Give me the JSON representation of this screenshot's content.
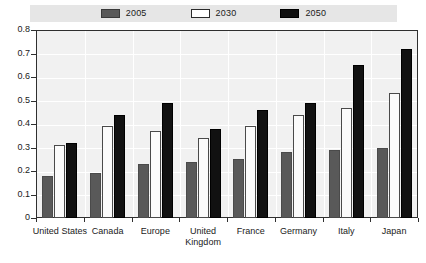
{
  "chart_data": {
    "type": "bar",
    "title": "",
    "xlabel": "",
    "ylabel": "",
    "ylim": [
      0,
      0.8
    ],
    "ytick_values": [
      "0.8",
      "0.7",
      "0.6",
      "0.5",
      "0.4",
      "0.3",
      "0.2",
      "0.1",
      "0"
    ],
    "grid": true,
    "legend_position": "top",
    "categories": [
      "United States",
      "Canada",
      "Europe",
      "United\nKingdom",
      "France",
      "Germany",
      "Italy",
      "Japan"
    ],
    "series": [
      {
        "name": "2005",
        "color": "#595959",
        "values": [
          0.18,
          0.19,
          0.23,
          0.24,
          0.25,
          0.28,
          0.29,
          0.3
        ]
      },
      {
        "name": "2030",
        "color": "#ffffff",
        "values": [
          0.31,
          0.39,
          0.37,
          0.34,
          0.39,
          0.44,
          0.47,
          0.53
        ]
      },
      {
        "name": "2050",
        "color": "#111111",
        "values": [
          0.32,
          0.44,
          0.49,
          0.38,
          0.46,
          0.49,
          0.65,
          0.72
        ]
      }
    ]
  },
  "legend": {
    "items": [
      {
        "label": "2005"
      },
      {
        "label": "2030"
      },
      {
        "label": "2050"
      }
    ]
  }
}
